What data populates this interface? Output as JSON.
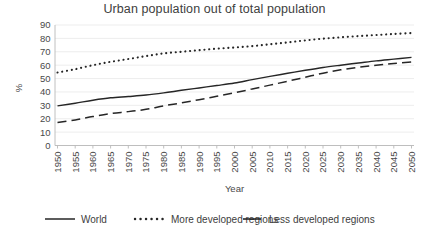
{
  "chart_data": {
    "type": "line",
    "title": "Urban population out of total population",
    "xlabel": "Year",
    "ylabel": "%",
    "ylim": [
      0,
      90
    ],
    "ytick_step": 10,
    "grid": true,
    "legend_position": "bottom",
    "x": [
      1950,
      1955,
      1960,
      1965,
      1970,
      1975,
      1980,
      1985,
      1990,
      1995,
      2000,
      2005,
      2010,
      2015,
      2020,
      2025,
      2030,
      2035,
      2040,
      2045,
      2050
    ],
    "xticklabels": [
      "1950",
      "1955",
      "1960",
      "1965",
      "1970",
      "1975",
      "1980",
      "1985",
      "1990",
      "1995",
      "2000",
      "2005",
      "2010",
      "2015",
      "2020",
      "2025",
      "2030",
      "2035",
      "2040",
      "2045",
      "2050"
    ],
    "yticklabels": [
      "0",
      "10",
      "20",
      "30",
      "40",
      "50",
      "60",
      "70",
      "80",
      "90"
    ],
    "series": [
      {
        "name": "World",
        "style": "solid",
        "color": "#262626",
        "values": [
          29.6,
          31.6,
          33.8,
          35.6,
          36.6,
          37.7,
          39.3,
          41.2,
          43.0,
          44.8,
          46.7,
          49.2,
          51.6,
          53.9,
          56.2,
          58.3,
          60.0,
          61.6,
          63.2,
          64.5,
          65.8
        ]
      },
      {
        "name": "More developed regions",
        "style": "dotted",
        "color": "#262626",
        "values": [
          54.5,
          57.0,
          60.0,
          62.5,
          64.6,
          66.8,
          68.8,
          70.0,
          71.2,
          72.3,
          73.2,
          74.2,
          75.6,
          77.0,
          78.5,
          79.8,
          80.8,
          81.7,
          82.5,
          83.3,
          84.0
        ]
      },
      {
        "name": "Less developed regions",
        "style": "dashed",
        "color": "#262626",
        "values": [
          17.1,
          19.1,
          21.6,
          23.8,
          25.3,
          27.0,
          29.6,
          31.8,
          34.2,
          36.8,
          39.4,
          42.2,
          45.1,
          48.0,
          51.0,
          54.0,
          56.5,
          58.4,
          60.0,
          61.3,
          62.4
        ]
      }
    ],
    "legend": [
      {
        "label": "World",
        "style": "solid"
      },
      {
        "label": "More developed regions",
        "style": "dotted"
      },
      {
        "label": "Less developed regions",
        "style": "dashed"
      }
    ]
  }
}
